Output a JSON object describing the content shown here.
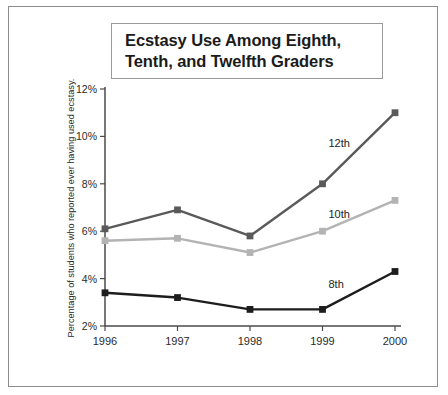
{
  "title": {
    "line1": "Ecstasy Use Among Eighth,",
    "line2": "Tenth, and Twelfth Graders"
  },
  "axis": {
    "y_title": "Percentage of students who reported ever having used ecstasy."
  },
  "chart_data": {
    "type": "line",
    "title": "Ecstasy Use Among Eighth, Tenth, and Twelfth Graders",
    "xlabel": "",
    "ylabel": "Percentage of students who reported ever having used ecstasy.",
    "categories": [
      "1996",
      "1997",
      "1998",
      "1999",
      "2000"
    ],
    "ytick_labels": [
      "2%",
      "4%",
      "6%",
      "8%",
      "10%",
      "12%"
    ],
    "ytick_values": [
      2,
      4,
      6,
      8,
      10,
      12
    ],
    "ylim": [
      2,
      12
    ],
    "grid": false,
    "legend_position": "inline-right",
    "series": [
      {
        "name": "12th",
        "label": "12th",
        "color": "#5a5a5a",
        "values": [
          6.1,
          6.9,
          5.8,
          8.0,
          11.0
        ]
      },
      {
        "name": "10th",
        "label": "10th",
        "color": "#b3b3b3",
        "values": [
          5.6,
          5.7,
          5.1,
          6.0,
          7.3
        ]
      },
      {
        "name": "8th",
        "label": "8th",
        "color": "#1d1d1d",
        "values": [
          3.4,
          3.2,
          2.7,
          2.7,
          4.3
        ]
      }
    ]
  }
}
